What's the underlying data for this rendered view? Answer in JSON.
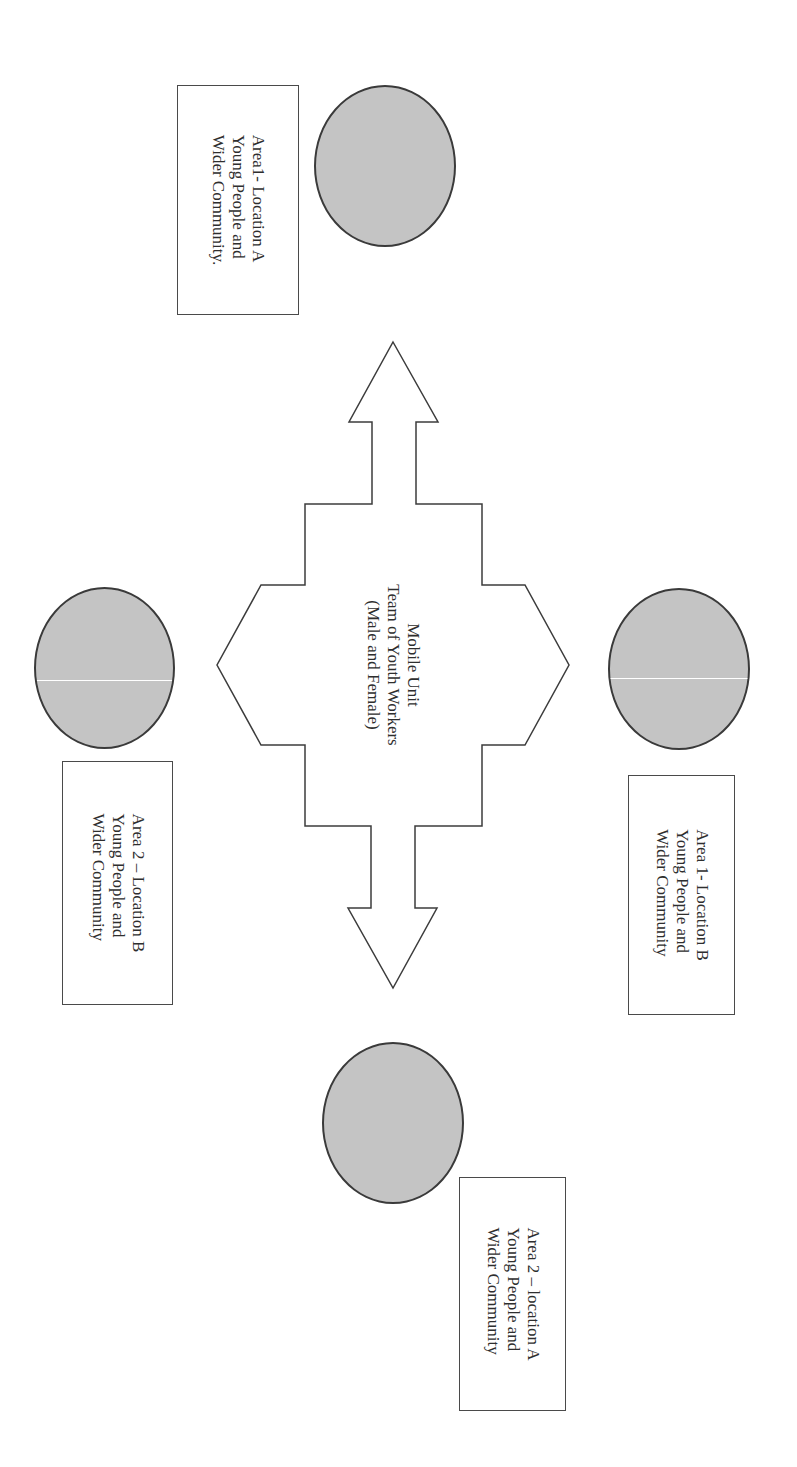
{
  "diagram": {
    "center": {
      "lines": [
        "Mobile Unit",
        "Team of Youth Workers",
        "(Male and Female)"
      ]
    },
    "nodes": [
      {
        "id": "area1-location-a",
        "position": "top",
        "lines": [
          "Area1- Location A",
          "Young People and",
          "Wider Community."
        ]
      },
      {
        "id": "area1-location-b",
        "position": "right",
        "lines": [
          "Area 1- Location B",
          "Young People and",
          "Wider Community"
        ]
      },
      {
        "id": "area2-location-a",
        "position": "bottom",
        "lines": [
          "Area 2 – location A",
          "Young People and",
          "Wider Community"
        ]
      },
      {
        "id": "area2-location-b",
        "position": "left",
        "lines": [
          "Area 2 – Location B",
          "Young People and",
          "Wider Community"
        ]
      }
    ],
    "colors": {
      "circle_fill": "#c4c4c4",
      "circle_stroke": "#3a3a3a",
      "arrow_stroke": "#3c3c3c",
      "box_stroke": "#4a4a4a",
      "background": "#ffffff"
    }
  }
}
